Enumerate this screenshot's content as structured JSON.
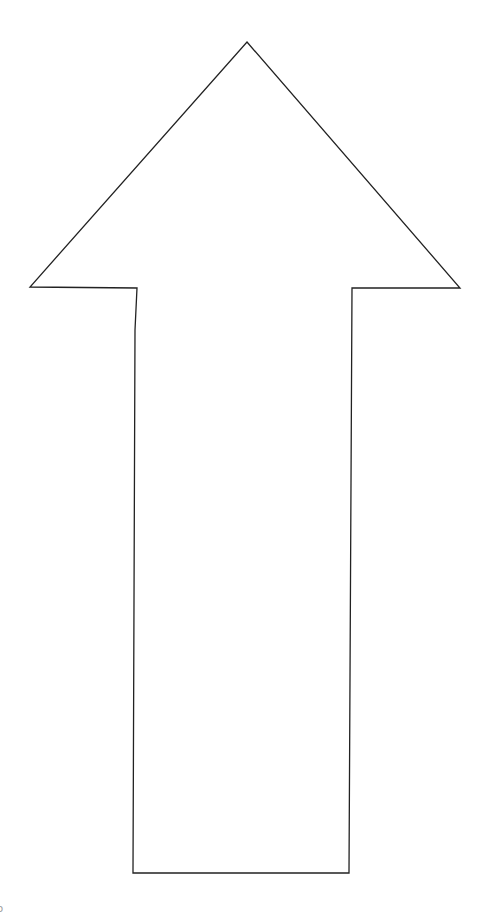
{
  "figure": {
    "shape": "up-arrow",
    "stroke_color": "#222222",
    "fill_color": "#ffffff",
    "background_color": "#ffffff"
  },
  "corner_mark": {
    "text": "o"
  }
}
